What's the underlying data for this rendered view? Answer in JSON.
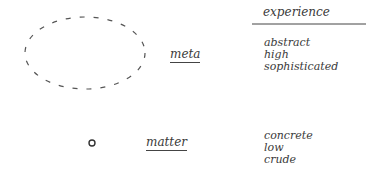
{
  "diagram": {
    "header": {
      "label": "experience"
    },
    "rows": [
      {
        "shape": "large-dashed-ellipse",
        "label": "meta",
        "attributes": [
          "abstract",
          "high",
          "sophisticated"
        ]
      },
      {
        "shape": "small-circle",
        "label": "matter",
        "attributes": [
          "concrete",
          "low",
          "crude"
        ]
      }
    ],
    "colors": {
      "ink": "#3a3a3a",
      "background": "#ffffff"
    }
  }
}
